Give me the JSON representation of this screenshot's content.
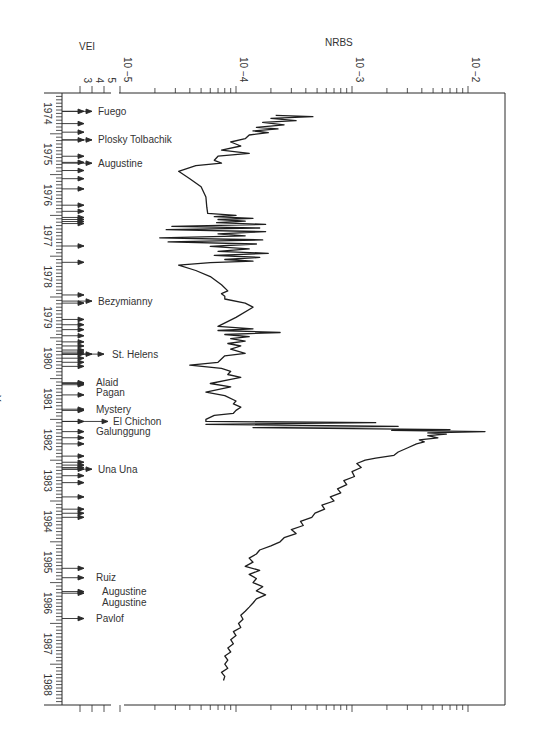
{
  "chart_data": {
    "type": "line",
    "title": "",
    "orientation": "rotated (time runs downward on vertical axis, NRBS on log horizontal axis)",
    "xlabel": "NRBS",
    "x_scale": "log",
    "x_ticks": [
      "10^-5",
      "10^-4",
      "10^-3",
      "10^-2"
    ],
    "xlim": [
      1e-05,
      0.014
    ],
    "ylabel": "Year",
    "y_ticks": [
      "1974",
      "1975",
      "1976",
      "1977",
      "1978",
      "1979",
      "1980",
      "1981",
      "1982",
      "1983",
      "1984",
      "1985",
      "1986",
      "1987",
      "1988"
    ],
    "ylim": [
      1974,
      1989
    ],
    "secondary_axis": {
      "label": "VEI",
      "ticks": [
        "3",
        "4",
        "5"
      ]
    },
    "grid": false,
    "legend": null,
    "series": [
      {
        "name": "NRBS",
        "points": [
          [
            1974.55,
            0.00022
          ],
          [
            1974.58,
            0.00046
          ],
          [
            1974.62,
            0.0002
          ],
          [
            1974.68,
            0.00033
          ],
          [
            1974.72,
            0.00017
          ],
          [
            1974.78,
            0.00026
          ],
          [
            1974.84,
            0.00015
          ],
          [
            1974.88,
            0.00023
          ],
          [
            1974.93,
            0.00014
          ],
          [
            1974.97,
            0.00019
          ],
          [
            1975.03,
            0.00013
          ],
          [
            1975.12,
            0.00012
          ],
          [
            1975.2,
            9e-05
          ],
          [
            1975.3,
            0.00011
          ],
          [
            1975.4,
            7.5e-05
          ],
          [
            1975.48,
            0.00013
          ],
          [
            1975.55,
            7e-05
          ],
          [
            1975.65,
            6.5e-05
          ],
          [
            1975.72,
            7.5e-05
          ],
          [
            1975.78,
            4.5e-05
          ],
          [
            1975.92,
            3.2e-05
          ],
          [
            1976.1,
            4e-05
          ],
          [
            1976.3,
            5e-05
          ],
          [
            1976.55,
            5.5e-05
          ],
          [
            1976.8,
            5.6e-05
          ],
          [
            1976.95,
            5.7e-05
          ],
          [
            1977.0,
            0.0001
          ],
          [
            1977.03,
            6.5e-05
          ],
          [
            1977.07,
            0.00014
          ],
          [
            1977.1,
            7e-05
          ],
          [
            1977.14,
            0.00012
          ],
          [
            1977.18,
            6.8e-05
          ],
          [
            1977.22,
            0.00018
          ],
          [
            1977.27,
            2.8e-05
          ],
          [
            1977.31,
            0.00016
          ],
          [
            1977.35,
            2.5e-05
          ],
          [
            1977.4,
            0.00018
          ],
          [
            1977.45,
            7e-05
          ],
          [
            1977.5,
            0.00012
          ],
          [
            1977.55,
            2.2e-05
          ],
          [
            1977.6,
            0.00017
          ],
          [
            1977.65,
            2.6e-05
          ],
          [
            1977.7,
            0.00015
          ],
          [
            1977.76,
            6e-05
          ],
          [
            1977.82,
            0.00013
          ],
          [
            1977.88,
            7e-05
          ],
          [
            1977.93,
            0.00019
          ],
          [
            1977.98,
            6.5e-05
          ],
          [
            1978.03,
            0.00016
          ],
          [
            1978.08,
            8e-05
          ],
          [
            1978.12,
            0.00014
          ],
          [
            1978.16,
            6e-05
          ],
          [
            1978.22,
            3.2e-05
          ],
          [
            1978.35,
            4.5e-05
          ],
          [
            1978.5,
            6e-05
          ],
          [
            1978.7,
            7.5e-05
          ],
          [
            1978.85,
            8.5e-05
          ],
          [
            1978.92,
            7.5e-05
          ],
          [
            1978.98,
            8e-05
          ],
          [
            1979.05,
            8e-05
          ],
          [
            1979.15,
            0.00012
          ],
          [
            1979.25,
            0.00014
          ],
          [
            1979.5,
            0.0001
          ],
          [
            1979.72,
            7e-05
          ],
          [
            1979.78,
            0.00014
          ],
          [
            1979.82,
            7e-05
          ],
          [
            1979.87,
            0.00024
          ],
          [
            1979.92,
            8e-05
          ],
          [
            1979.97,
            0.00013
          ],
          [
            1980.02,
            9e-05
          ],
          [
            1980.08,
            0.00012
          ],
          [
            1980.14,
            8.5e-05
          ],
          [
            1980.2,
            0.00011
          ],
          [
            1980.28,
            9e-05
          ],
          [
            1980.38,
            0.00012
          ],
          [
            1980.44,
            8e-05
          ],
          [
            1980.6,
            7e-05
          ],
          [
            1980.67,
            4e-05
          ],
          [
            1980.75,
            7.5e-05
          ],
          [
            1980.82,
            9e-05
          ],
          [
            1980.9,
            8.5e-05
          ],
          [
            1980.97,
            0.00011
          ],
          [
            1981.02,
            9e-05
          ],
          [
            1981.12,
            6e-05
          ],
          [
            1981.2,
            9e-05
          ],
          [
            1981.33,
            5.5e-05
          ],
          [
            1981.42,
            8e-05
          ],
          [
            1981.55,
            0.0001
          ],
          [
            1981.62,
            9.5e-05
          ],
          [
            1981.7,
            0.00011
          ],
          [
            1981.78,
            0.0001
          ],
          [
            1981.85,
            9.5e-05
          ],
          [
            1981.9,
            6.5e-05
          ],
          [
            1982.0,
            5.5e-05
          ],
          [
            1982.05,
            5.5e-05
          ],
          [
            1982.08,
            0.0016
          ],
          [
            1982.12,
            5.5e-05
          ],
          [
            1982.17,
            0.0025
          ],
          [
            1982.2,
            0.00014
          ],
          [
            1982.25,
            0.007
          ],
          [
            1982.27,
            0.0022
          ],
          [
            1982.3,
            0.014
          ],
          [
            1982.33,
            0.0045
          ],
          [
            1982.36,
            0.0065
          ],
          [
            1982.4,
            0.0045
          ],
          [
            1982.45,
            0.0055
          ],
          [
            1982.5,
            0.0038
          ],
          [
            1982.55,
            0.0042
          ],
          [
            1982.6,
            0.0036
          ],
          [
            1982.7,
            0.003
          ],
          [
            1982.8,
            0.0025
          ],
          [
            1982.88,
            0.0023
          ],
          [
            1982.95,
            0.0016
          ],
          [
            1983.0,
            0.0013
          ],
          [
            1983.08,
            0.0011
          ],
          [
            1983.18,
            0.0012
          ],
          [
            1983.28,
            0.001
          ],
          [
            1983.4,
            0.00105
          ],
          [
            1983.5,
            0.00085
          ],
          [
            1983.6,
            0.0009
          ],
          [
            1983.7,
            0.00075
          ],
          [
            1983.8,
            0.0008
          ],
          [
            1983.9,
            0.00065
          ],
          [
            1984.0,
            0.0007
          ],
          [
            1984.1,
            0.00055
          ],
          [
            1984.2,
            0.00058
          ],
          [
            1984.3,
            0.00048
          ],
          [
            1984.4,
            0.00045
          ],
          [
            1984.5,
            0.00036
          ],
          [
            1984.6,
            0.00038
          ],
          [
            1984.7,
            0.0003
          ],
          [
            1984.8,
            0.00033
          ],
          [
            1984.9,
            0.00026
          ],
          [
            1985.0,
            0.00024
          ],
          [
            1985.1,
            0.0002
          ],
          [
            1985.2,
            0.00016
          ],
          [
            1985.3,
            0.00015
          ],
          [
            1985.4,
            0.00013
          ],
          [
            1985.5,
            0.00014
          ],
          [
            1985.6,
            0.00012
          ],
          [
            1985.7,
            0.00016
          ],
          [
            1985.8,
            0.00013
          ],
          [
            1985.9,
            0.00015
          ],
          [
            1986.0,
            0.00014
          ],
          [
            1986.1,
            0.00017
          ],
          [
            1986.2,
            0.00015
          ],
          [
            1986.3,
            0.00018
          ],
          [
            1986.4,
            0.00015
          ],
          [
            1986.5,
            0.00014
          ],
          [
            1986.6,
            0.00013
          ],
          [
            1986.7,
            0.00012
          ],
          [
            1986.8,
            0.00011
          ],
          [
            1986.9,
            0.000115
          ],
          [
            1987.0,
            0.000105
          ],
          [
            1987.1,
            0.00011
          ],
          [
            1987.2,
            9.5e-05
          ],
          [
            1987.3,
            0.0001
          ],
          [
            1987.4,
            9e-05
          ],
          [
            1987.5,
            9.5e-05
          ],
          [
            1987.6,
            8.5e-05
          ],
          [
            1987.7,
            9e-05
          ],
          [
            1987.8,
            8e-05
          ],
          [
            1987.9,
            8.5e-05
          ],
          [
            1988.0,
            8e-05
          ],
          [
            1988.1,
            8.5e-05
          ],
          [
            1988.2,
            7.5e-05
          ],
          [
            1988.3,
            8e-05
          ],
          [
            1988.4,
            7.8e-05
          ]
        ]
      }
    ],
    "annotations": [
      {
        "text": "Fuego",
        "year": 1974.45,
        "arrow": "long"
      },
      {
        "text": "Plosky Tolbachik",
        "year": 1975.15,
        "arrow": "long"
      },
      {
        "text": "Augustine",
        "year": 1975.72,
        "arrow": "long"
      },
      {
        "text": "Bezymianny",
        "year": 1979.1,
        "arrow": "long"
      },
      {
        "text": "St. Helens",
        "year": 1980.4,
        "arrow": "long"
      },
      {
        "text": "Alaid",
        "year": 1981.1,
        "arrow": "short"
      },
      {
        "text": "Pagan",
        "year": 1981.35,
        "arrow": "none"
      },
      {
        "text": "Mystery",
        "year": 1981.75,
        "arrow": "short"
      },
      {
        "text": "El Chichon",
        "year": 1982.05,
        "arrow": "longest"
      },
      {
        "text": "Galunggung",
        "year": 1982.3,
        "arrow": "short"
      },
      {
        "text": "Una Una",
        "year": 1983.22,
        "arrow": "long"
      },
      {
        "text": "Ruiz",
        "year": 1985.88,
        "arrow": "short"
      },
      {
        "text": "Augustine",
        "year": 1986.22,
        "arrow": "short"
      },
      {
        "text": "Augustine",
        "year": 1986.48,
        "arrow": "none"
      },
      {
        "text": "Pavlof",
        "year": 1986.88,
        "arrow": "short"
      }
    ],
    "eruption_markers_years": [
      1974.45,
      1974.75,
      1974.96,
      1975.15,
      1975.55,
      1975.7,
      1975.9,
      1976.1,
      1976.35,
      1976.75,
      1976.9,
      1977.05,
      1977.1,
      1977.15,
      1977.2,
      1977.75,
      1978.15,
      1978.95,
      1979.15,
      1979.55,
      1979.68,
      1979.8,
      1979.95,
      1980.1,
      1980.2,
      1980.3,
      1980.35,
      1980.4,
      1980.5,
      1980.6,
      1980.7,
      1981.1,
      1981.12,
      1981.15,
      1981.4,
      1981.75,
      1981.78,
      1982.05,
      1982.3,
      1982.45,
      1982.6,
      1982.9,
      1983.05,
      1983.12,
      1983.18,
      1983.22,
      1983.38,
      1983.55,
      1983.9,
      1984.2,
      1984.3,
      1984.4,
      1985.65,
      1985.88,
      1986.22,
      1986.26,
      1986.88
    ]
  },
  "labels": {
    "nrbs": "NRBS",
    "vei": "VEI",
    "year": "Year",
    "vei_ticks": [
      "3",
      "4",
      "5"
    ],
    "log_ticks": [
      {
        "base": "10",
        "exp": "−5"
      },
      {
        "base": "10",
        "exp": "−4"
      },
      {
        "base": "10",
        "exp": "−3"
      },
      {
        "base": "10",
        "exp": "−2"
      }
    ]
  }
}
